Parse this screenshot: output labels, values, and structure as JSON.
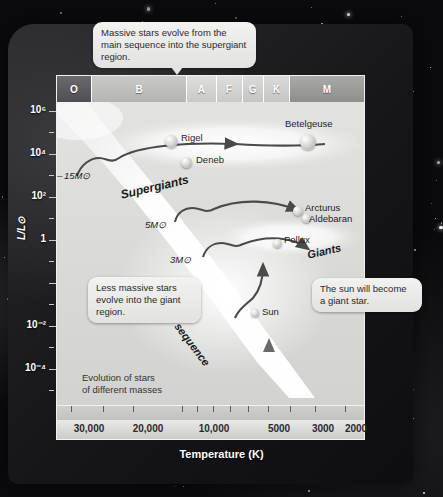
{
  "figure": {
    "caption": "Evolution of stars\nof different masses",
    "caption_line1": "Evolution of stars",
    "caption_line2": "of different masses"
  },
  "axes": {
    "y_title": "L/L⊙",
    "y_labels": [
      "10⁶",
      "10⁴",
      "10²",
      "1",
      "10⁻²",
      "10⁻⁴"
    ],
    "y_values": [
      1000000,
      10000,
      100,
      1,
      0.01,
      0.0001
    ],
    "x_title": "Temperature (K)",
    "x_labels": [
      "30,000",
      "20,000",
      "10,000",
      "5000",
      "3000",
      "2000"
    ],
    "x_values": [
      30000,
      20000,
      10000,
      5000,
      3000,
      2000
    ]
  },
  "spectral_classes": [
    {
      "label": "O",
      "width_pct": 11.5
    },
    {
      "label": "B",
      "width_pct": 31.0
    },
    {
      "label": "A",
      "width_pct": 9.5
    },
    {
      "label": "F",
      "width_pct": 8.5
    },
    {
      "label": "G",
      "width_pct": 7.0
    },
    {
      "label": "K",
      "width_pct": 8.5
    },
    {
      "label": "M",
      "width_pct": 24.0
    }
  ],
  "callouts": {
    "top": "Massive stars evolve from the main sequence into the supergiant region.",
    "left": "Less massive stars evolve into the giant region.",
    "right": "The sun will become a giant star."
  },
  "regions": [
    {
      "name": "Supergiants",
      "label": "Supergiants"
    },
    {
      "name": "Giants",
      "label": "Giants"
    },
    {
      "name": "Main sequence",
      "label": "Main sequence"
    }
  ],
  "stars": [
    {
      "name": "Rigel",
      "label": "Rigel"
    },
    {
      "name": "Deneb",
      "label": "Deneb"
    },
    {
      "name": "Betelgeuse",
      "label": "Betelgeuse"
    },
    {
      "name": "Arcturus",
      "label": "Arcturus"
    },
    {
      "name": "Aldebaran",
      "label": "Aldebaran"
    },
    {
      "name": "Pollux",
      "label": "Pollux"
    },
    {
      "name": "Sun",
      "label": "Sun"
    }
  ],
  "mass_tracks": [
    {
      "label": "15M⊙",
      "mass": 15
    },
    {
      "label": "5M⊙",
      "mass": 5
    },
    {
      "label": "3M⊙",
      "mass": 3
    }
  ],
  "chart_data": {
    "type": "scatter",
    "title": "Evolution of stars of different masses",
    "xlabel": "Temperature (K)",
    "ylabel": "L/L⊙",
    "xlim": [
      32000,
      1900
    ],
    "ylim": [
      0.0001,
      3000000
    ],
    "x_scale": "log-reversed",
    "y_scale": "log",
    "xticks": [
      30000,
      20000,
      10000,
      5000,
      3000,
      2000
    ],
    "xticklabels": [
      "30,000",
      "20,000",
      "10,000",
      "5000",
      "3000",
      "2000"
    ],
    "yticks": [
      1000000,
      10000,
      100,
      1,
      0.01,
      0.0001
    ],
    "yticklabels": [
      "10⁶",
      "10⁴",
      "10²",
      "1",
      "10⁻²",
      "10⁻⁴"
    ],
    "grid": false,
    "legend": "none",
    "top_axis": {
      "name": "Spectral class",
      "categories": [
        "O",
        "B",
        "A",
        "F",
        "G",
        "K",
        "M"
      ]
    },
    "points": [
      {
        "label": "Rigel",
        "temperature": 11000,
        "luminosity": 120000
      },
      {
        "label": "Deneb",
        "temperature": 8500,
        "luminosity": 60000
      },
      {
        "label": "Betelgeuse",
        "temperature": 3500,
        "luminosity": 100000
      },
      {
        "label": "Arcturus",
        "temperature": 4300,
        "luminosity": 170
      },
      {
        "label": "Aldebaran",
        "temperature": 3900,
        "luminosity": 150
      },
      {
        "label": "Pollux",
        "temperature": 4800,
        "luminosity": 40
      },
      {
        "label": "Sun",
        "temperature": 5800,
        "luminosity": 1
      }
    ],
    "series": [
      {
        "name": "15M⊙ evolutionary track",
        "start": {
          "temperature": 28000,
          "luminosity": 20000
        },
        "end": {
          "temperature": 3500,
          "luminosity": 100000
        }
      },
      {
        "name": "5M⊙ evolutionary track",
        "start": {
          "temperature": 15000,
          "luminosity": 600
        },
        "end": {
          "temperature": 4300,
          "luminosity": 170
        }
      },
      {
        "name": "3M⊙ evolutionary track",
        "start": {
          "temperature": 11000,
          "luminosity": 80
        },
        "end": {
          "temperature": 4300,
          "luminosity": 100
        }
      },
      {
        "name": "Sun evolutionary track",
        "start": {
          "temperature": 5800,
          "luminosity": 1
        },
        "end": {
          "temperature": 4600,
          "luminosity": 60
        }
      }
    ],
    "annotations": [
      {
        "text": "Supergiants",
        "temperature": 13000,
        "luminosity": 9000
      },
      {
        "text": "Giants",
        "temperature": 3400,
        "luminosity": 40
      },
      {
        "text": "Main sequence",
        "temperature": 7500,
        "luminosity": 3
      }
    ]
  }
}
